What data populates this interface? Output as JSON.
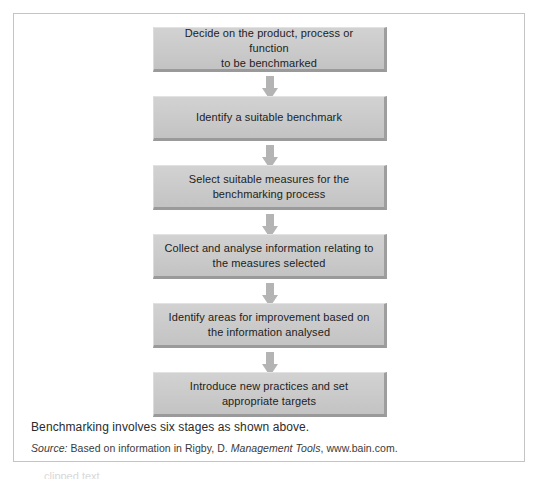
{
  "figure": {
    "title_absent": true,
    "caption": "Benchmarking involves six stages as shown above.",
    "source": {
      "label": "Source:",
      "prefix": " Based on information in Rigby, D. ",
      "title": "Management Tools",
      "suffix": ", www.bain.com."
    },
    "colors": {
      "box_fill": "#cacaca",
      "box_shadow": "#9a9a9a",
      "arrow": "#b4b4b4",
      "frame_border": "#c4c4c4",
      "text": "#1d1d1d",
      "page_background": "#ffffff"
    },
    "flow": {
      "orientation": "vertical",
      "step_count": 6,
      "arrow_name": "down-arrow-icon",
      "steps": [
        {
          "index": 1,
          "label": "Decide on the product, process or function\nto be benchmarked"
        },
        {
          "index": 2,
          "label": "Identify a suitable benchmark"
        },
        {
          "index": 3,
          "label": "Select suitable measures for the\nbenchmarking process"
        },
        {
          "index": 4,
          "label": "Collect and analyse information relating to\nthe measures selected"
        },
        {
          "index": 5,
          "label": "Identify areas for improvement based on\nthe information analysed"
        },
        {
          "index": 6,
          "label": "Introduce new practices and set\nappropriate targets"
        }
      ]
    }
  },
  "page_footer_sliver": "clipped text"
}
